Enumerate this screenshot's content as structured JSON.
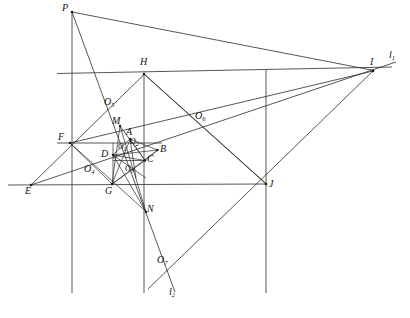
{
  "figure": {
    "background_color": "#ffffff",
    "line_color": "#2b2b2b",
    "label_color": "#111111",
    "width": 410,
    "height": 318
  },
  "labels": {
    "P": "P",
    "H": "H",
    "I": "I",
    "l1": "l",
    "l1_sub": "1",
    "O5": "O",
    "O5_sub": "5",
    "O6": "O",
    "O6_sub": "6",
    "F": "F",
    "M": "M",
    "A": "A",
    "B": "B",
    "D": "D",
    "C": "C",
    "O2": "O",
    "O2_sub": "2",
    "O1": "O",
    "O1_sub": "1",
    "O3": "O",
    "O3_sub": "3",
    "O4": "O",
    "O4_sub": "4",
    "E": "E",
    "G": "G",
    "J": "J",
    "N": "N",
    "O7": "O",
    "O7_sub": "7",
    "l2": "l",
    "l2_sub": "2"
  },
  "points": {
    "P": {
      "x": 72,
      "y": 12
    },
    "H": {
      "x": 144,
      "y": 74
    },
    "I": {
      "x": 373,
      "y": 71
    },
    "F": {
      "x": 70,
      "y": 143
    },
    "E": {
      "x": 31,
      "y": 185
    },
    "G": {
      "x": 112,
      "y": 184
    },
    "J": {
      "x": 266,
      "y": 184
    },
    "M": {
      "x": 120,
      "y": 126
    },
    "A": {
      "x": 130,
      "y": 139
    },
    "B": {
      "x": 157,
      "y": 150
    },
    "C": {
      "x": 145,
      "y": 160
    },
    "D": {
      "x": 113,
      "y": 155
    },
    "N": {
      "x": 146,
      "y": 212
    },
    "O1": {
      "x": 126,
      "y": 151
    },
    "O2": {
      "x": 134,
      "y": 146
    },
    "O3": {
      "x": 133,
      "y": 172
    },
    "O4": {
      "x": 94,
      "y": 172
    },
    "O5": {
      "x": 114,
      "y": 107
    },
    "O6": {
      "x": 203,
      "y": 121
    },
    "O7": {
      "x": 165,
      "y": 265
    },
    "l1": {
      "x": 395,
      "y": 62
    },
    "l2": {
      "x": 175,
      "y": 295
    }
  },
  "label_offsets": {
    "P": {
      "x": 62,
      "y": 4
    },
    "H": {
      "x": 140,
      "y": 58
    },
    "I": {
      "x": 370,
      "y": 58
    },
    "l1": {
      "x": 389,
      "y": 50
    },
    "O5": {
      "x": 105,
      "y": 98
    },
    "O6": {
      "x": 196,
      "y": 112
    },
    "F": {
      "x": 59,
      "y": 133
    },
    "M": {
      "x": 113,
      "y": 117
    },
    "A": {
      "x": 126,
      "y": 128
    },
    "B": {
      "x": 159,
      "y": 145
    },
    "D": {
      "x": 103,
      "y": 150
    },
    "C": {
      "x": 147,
      "y": 155
    },
    "O2": {
      "x": 130,
      "y": 139
    },
    "O1": {
      "x": 120,
      "y": 144
    },
    "O3": {
      "x": 126,
      "y": 166
    },
    "O4": {
      "x": 85,
      "y": 165
    },
    "E": {
      "x": 26,
      "y": 186
    },
    "G": {
      "x": 106,
      "y": 186
    },
    "J": {
      "x": 269,
      "y": 180
    },
    "N": {
      "x": 147,
      "y": 204
    },
    "O7": {
      "x": 158,
      "y": 256
    },
    "l2": {
      "x": 170,
      "y": 288
    }
  },
  "segments": [
    {
      "name": "horizontal-through-H",
      "from": [
        57,
        74
      ],
      "to": [
        390,
        67
      ]
    },
    {
      "name": "horizontal-through-F",
      "from": [
        57,
        143
      ],
      "to": [
        160,
        143
      ]
    },
    {
      "name": "horizontal-through-E",
      "from": [
        8,
        185
      ],
      "to": [
        266,
        184
      ]
    },
    {
      "name": "vertical-left",
      "from": [
        72,
        12
      ],
      "to": [
        72,
        293
      ]
    },
    {
      "name": "vertical-mid",
      "from": [
        144,
        74
      ],
      "to": [
        144,
        185
      ]
    },
    {
      "name": "vertical-mid-lower",
      "from": [
        144,
        185
      ],
      "to": [
        144,
        293
      ]
    },
    {
      "name": "vertical-right",
      "from": [
        266,
        71
      ],
      "to": [
        266,
        293
      ]
    },
    {
      "name": "P-to-I",
      "from": [
        72,
        12
      ],
      "to": [
        373,
        71
      ]
    },
    {
      "name": "P-to-N",
      "from": [
        72,
        12
      ],
      "to": [
        146,
        212
      ]
    },
    {
      "name": "P-to-O7",
      "from": [
        146,
        212
      ],
      "to": [
        168,
        272
      ]
    },
    {
      "name": "E-to-H",
      "from": [
        31,
        185
      ],
      "to": [
        144,
        74
      ]
    },
    {
      "name": "H-to-O5-F-E",
      "from": [
        144,
        74
      ],
      "to": [
        31,
        185
      ]
    },
    {
      "name": "E-to-I",
      "from": [
        31,
        185
      ],
      "to": [
        395,
        62
      ]
    },
    {
      "name": "F-to-B-O6-I",
      "from": [
        70,
        143
      ],
      "to": [
        373,
        71
      ]
    },
    {
      "name": "H-to-J",
      "from": [
        144,
        74
      ],
      "to": [
        266,
        184
      ]
    },
    {
      "name": "I-to-J",
      "from": [
        373,
        71
      ],
      "to": [
        266,
        184
      ]
    },
    {
      "name": "J-to-l2",
      "from": [
        266,
        184
      ],
      "to": [
        148,
        288
      ]
    },
    {
      "name": "F-to-G",
      "from": [
        70,
        143
      ],
      "to": [
        112,
        184
      ]
    },
    {
      "name": "F-to-N",
      "from": [
        70,
        143
      ],
      "to": [
        146,
        212
      ]
    },
    {
      "name": "M-to-G",
      "from": [
        120,
        126
      ],
      "to": [
        112,
        184
      ]
    },
    {
      "name": "M-to-N",
      "from": [
        120,
        126
      ],
      "to": [
        146,
        212
      ]
    },
    {
      "name": "M-to-C",
      "from": [
        120,
        126
      ],
      "to": [
        145,
        160
      ]
    },
    {
      "name": "G-to-B",
      "from": [
        112,
        184
      ],
      "to": [
        157,
        150
      ]
    },
    {
      "name": "G-to-A",
      "from": [
        112,
        184
      ],
      "to": [
        130,
        139
      ]
    },
    {
      "name": "D-to-B",
      "from": [
        113,
        155
      ],
      "to": [
        157,
        150
      ]
    },
    {
      "name": "D-to-C",
      "from": [
        113,
        155
      ],
      "to": [
        145,
        160
      ]
    },
    {
      "name": "A-to-C",
      "from": [
        130,
        139
      ],
      "to": [
        145,
        160
      ]
    },
    {
      "name": "A-to-D",
      "from": [
        130,
        139
      ],
      "to": [
        113,
        155
      ]
    },
    {
      "name": "B-to-C",
      "from": [
        157,
        150
      ],
      "to": [
        145,
        160
      ]
    },
    {
      "name": "D-to-N",
      "from": [
        113,
        155
      ],
      "to": [
        146,
        212
      ]
    },
    {
      "name": "C-to-G",
      "from": [
        145,
        160
      ],
      "to": [
        112,
        184
      ]
    },
    {
      "name": "A-to-O3",
      "from": [
        130,
        139
      ],
      "to": [
        133,
        172
      ]
    },
    {
      "name": "D-to-O3",
      "from": [
        113,
        155
      ],
      "to": [
        145,
        175
      ]
    }
  ]
}
